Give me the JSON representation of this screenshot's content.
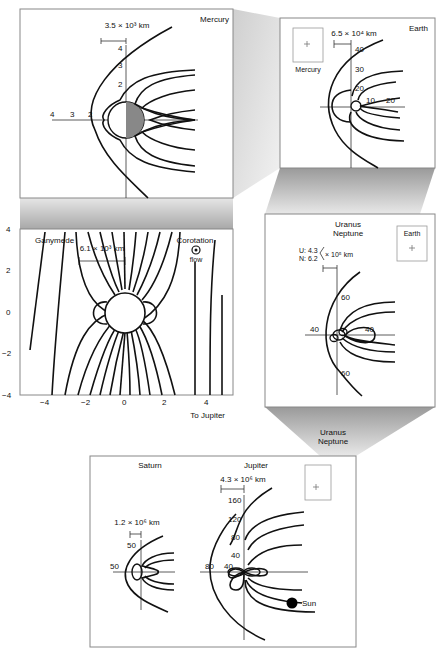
{
  "figure": {
    "panels": {
      "mercury": {
        "title": "Mercury",
        "scale": "3.5 × 10³ km",
        "x_ticks": [
          "4",
          "3",
          "2"
        ],
        "y_ticks": [
          "4",
          "3",
          "2"
        ]
      },
      "earth": {
        "title": "Earth",
        "scale": "6.5 × 10⁴ km",
        "inset_label": "Mercury",
        "y_ticks": [
          "40",
          "30",
          "20"
        ],
        "x_ticks": [
          "10",
          "20"
        ]
      },
      "ganymede": {
        "title": "Ganymede",
        "scale": "6.1 × 10³ km",
        "corotation_label": "Corotation",
        "flow_label": "flow",
        "x_ticks": [
          "−4",
          "−2",
          "0",
          "2",
          "4"
        ],
        "y_ticks": [
          "4",
          "2",
          "0",
          "−2",
          "−4"
        ],
        "x_axis_note": "To Jupiter"
      },
      "uranus_neptune": {
        "title_line1": "Uranus",
        "title_line2": "Neptune",
        "scale_u": "U: 4.3",
        "scale_n": "N: 6.2",
        "scale_unit": "× 10⁵ km",
        "inset_label": "Earth",
        "ticks_top": "60",
        "ticks_bottom": "60",
        "tick_left": "40",
        "tick_right": "40"
      },
      "outer": {
        "saturn_title": "Saturn",
        "jupiter_title": "Jupiter",
        "saturn_scale": "1.2 × 10⁶ km",
        "jupiter_scale": "4.3 × 10⁶ km",
        "saturn_y_tick": "50",
        "saturn_x_tick": "50",
        "jupiter_y_ticks": [
          "160",
          "120",
          "80",
          "40"
        ],
        "jupiter_x_ticks": [
          "80",
          "40"
        ],
        "sun_label": "Sun",
        "inset_label_line1": "Uranus",
        "inset_label_line2": "Neptune"
      }
    }
  }
}
